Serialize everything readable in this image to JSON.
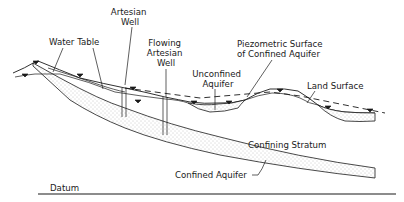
{
  "diagram": {
    "labels": {
      "artesian_well_1": "Artesian",
      "artesian_well_2": "Well",
      "water_table": "Water  Table",
      "flowing_well_1": "Flowing",
      "flowing_well_2": "Artesian",
      "flowing_well_3": "Well",
      "unconfined_1": "Unconfined",
      "unconfined_2": "Aquifer",
      "piezometric_1": "Piezometric  Surface",
      "piezometric_2": "of  Confined  Aquifer",
      "land_surface": "Land  Surface",
      "confining_stratum": "Confining  Stratum",
      "confined_aquifer": "Confined  Aquifer",
      "datum": "Datum"
    },
    "symbols": {
      "water_level_marker": "water-table-triangle"
    },
    "colors": {
      "ink": "#1a1a1a",
      "background": "#ffffff",
      "stipple": "#8a8a8a"
    }
  }
}
